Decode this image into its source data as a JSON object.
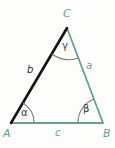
{
  "figure": {
    "type": "triangle-diagram",
    "background_color": "#fdfdfc",
    "colors": {
      "teal": "#62a492",
      "black": "#141414",
      "arc_gray": "#777777",
      "label_teal": "#5fa08f",
      "label_dark": "#2b2b2b"
    },
    "vertices": [
      {
        "name": "A",
        "label": "A",
        "x": 11,
        "y": 123,
        "label_x": 4,
        "label_y": 130,
        "color": "#5fa08f"
      },
      {
        "name": "B",
        "label": "B",
        "x": 103,
        "y": 123,
        "label_x": 103,
        "label_y": 130,
        "color": "#5fa08f"
      },
      {
        "name": "C",
        "label": "C",
        "x": 67,
        "y": 28,
        "label_x": 63,
        "label_y": 9,
        "color": "#5fa08f"
      }
    ],
    "sides": [
      {
        "name": "side-b",
        "label": "b",
        "from": "A",
        "to": "C",
        "color": "#141414",
        "width": 2.4,
        "label_x": 28,
        "label_y": 68,
        "label_color": "#2b2b2b"
      },
      {
        "name": "side-a",
        "label": "a",
        "from": "C",
        "to": "B",
        "color": "#62a492",
        "width": 1.6,
        "label_x": 86,
        "label_y": 62,
        "label_color": "#62a492"
      },
      {
        "name": "side-c",
        "label": "c",
        "from": "A",
        "to": "B",
        "color": "#62a492",
        "width": 1.6,
        "label_x": 55,
        "label_y": 130,
        "label_color": "#62a492"
      }
    ],
    "angles": [
      {
        "name": "angle-alpha",
        "label": "α",
        "vertex": "A",
        "arc_color": "#777777",
        "label_x": 21,
        "label_y": 110
      },
      {
        "name": "angle-beta",
        "label": "β",
        "vertex": "B",
        "arc_color": "#777777",
        "label_x": 84,
        "label_y": 108
      },
      {
        "name": "angle-gamma",
        "label": "γ",
        "vertex": "C",
        "arc_color": "#777777",
        "label_x": 62,
        "label_y": 44
      }
    ]
  }
}
